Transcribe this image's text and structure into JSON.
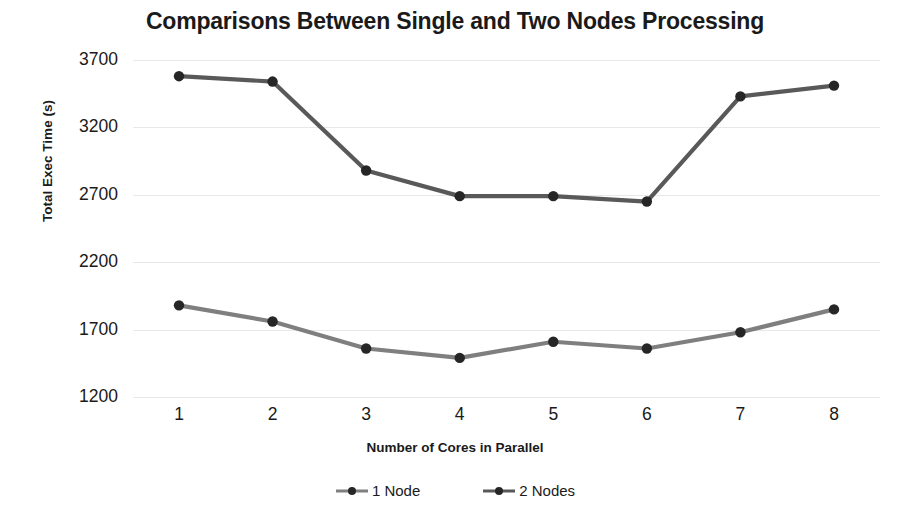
{
  "chart_data": {
    "type": "line",
    "title": "Comparisons Between Single and Two Nodes Processing",
    "xlabel": "Number of Cores in Parallel",
    "ylabel": "Total Exec Time (s)",
    "categories": [
      "1",
      "2",
      "3",
      "4",
      "5",
      "6",
      "7",
      "8"
    ],
    "x": [
      1,
      2,
      3,
      4,
      5,
      6,
      7,
      8
    ],
    "ylim": [
      1200,
      3700
    ],
    "yticks": [
      1200,
      1700,
      2200,
      2700,
      3200,
      3700
    ],
    "ytick_labels": [
      "1200",
      "1700",
      "2200",
      "2700",
      "3200",
      "3700"
    ],
    "xtick_labels": [
      "1",
      "2",
      "3",
      "4",
      "5",
      "6",
      "7",
      "8"
    ],
    "grid": "horizontal",
    "legend_position": "bottom",
    "series": [
      {
        "name": "1 Node",
        "color": "#7f7f7f",
        "marker_color": "#262626",
        "values": [
          1880,
          1760,
          1560,
          1490,
          1610,
          1560,
          1680,
          1850
        ]
      },
      {
        "name": "2 Nodes",
        "color": "#595959",
        "marker_color": "#262626",
        "values": [
          3580,
          3540,
          2880,
          2690,
          2690,
          2650,
          3430,
          3510
        ]
      }
    ]
  },
  "legend": {
    "entries": [
      {
        "label": "1 Node"
      },
      {
        "label": "2 Nodes"
      }
    ]
  },
  "colors": {
    "background": "#ffffff",
    "text": "#1a1a1a",
    "gridline": "#e8e8e8",
    "series_1_node": "#7f7f7f",
    "series_2_nodes": "#595959",
    "marker": "#262626"
  }
}
